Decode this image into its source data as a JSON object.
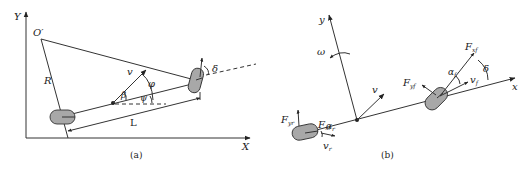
{
  "panel_a": {
    "caption": "(a)",
    "axis_x": "X",
    "axis_y": "Y",
    "center_label": "O′",
    "radius_label": "R",
    "velocity_label": "v",
    "slip_angle_label": "β",
    "heading_label": "ψ",
    "course_label": "φ",
    "steer_label": "δ",
    "wheelbase_label": "L",
    "colors": {
      "wheel_fill": "#a8a8a8",
      "line": "#333333"
    }
  },
  "panel_b": {
    "caption": "(b)",
    "axis_x": "x",
    "axis_y": "y",
    "yaw_rate_label": "ω",
    "velocity_label": "v",
    "front_lateral_force": {
      "main": "F",
      "sub": "yf"
    },
    "front_long_force": {
      "main": "F",
      "sub": "xf"
    },
    "rear_lateral_force": {
      "main": "F",
      "sub": "yr"
    },
    "rear_long_force": {
      "main": "F",
      "sub": "xr"
    },
    "front_slip_angle": {
      "main": "α",
      "sub": "f"
    },
    "rear_slip_angle": {
      "main": "α",
      "sub": "r"
    },
    "front_velocity": {
      "main": "v",
      "sub": "f"
    },
    "rear_velocity": {
      "main": "v",
      "sub": "r"
    },
    "steer_label": "δ"
  }
}
